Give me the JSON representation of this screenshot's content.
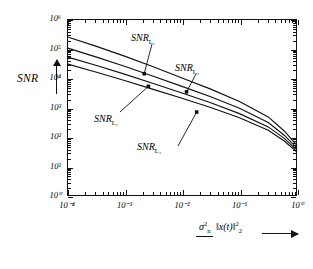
{
  "axes": {
    "y_title": "SNR",
    "y_ticks": [
      "10⁰",
      "10¹",
      "10²",
      "10³",
      "10⁴",
      "10⁵",
      "10⁶"
    ],
    "y_tick_mantissa": "10",
    "x_ticks": [
      "10⁻⁴",
      "10⁻³",
      "10⁻²",
      "10⁻¹",
      "10⁰"
    ],
    "x_label_numerator": "σ",
    "x_label_num_sup": "2",
    "x_label_num_sub": "n",
    "x_label_denominator_open": "‖",
    "x_label_denominator_body": "x(t)",
    "x_label_denominator_close": "‖",
    "x_label_den_sup": "2",
    "x_label_den_sub": "2"
  },
  "curve_labels": {
    "c1": "SNR",
    "c1_sub": "L₁",
    "c2": "SNR",
    "c2_sub": "L₂",
    "c3": "SNR",
    "c3_sub": "L₃",
    "c4": "SNR",
    "c4_sub": "L₄"
  },
  "chart_data": {
    "type": "line",
    "title": "",
    "xlabel": "σ²_n / ‖x(t)‖²₂",
    "ylabel": "SNR",
    "xscale": "log",
    "yscale": "log",
    "xlim": [
      0.0001,
      1
    ],
    "ylim": [
      1,
      1000000
    ],
    "grid": false,
    "legend": "annotations-on-curves",
    "frame": true,
    "line_color": "#111111",
    "x": [
      0.0001,
      0.000316,
      0.001,
      0.00316,
      0.01,
      0.0316,
      0.1,
      0.316,
      0.6,
      1.0
    ],
    "series": [
      {
        "name": "SNR_L1",
        "values": [
          250000,
          120000,
          55000,
          24000,
          10000,
          4200,
          1600,
          480,
          160,
          52
        ]
      },
      {
        "name": "SNR_L2",
        "values": [
          105000,
          52000,
          25000,
          11500,
          5200,
          2300,
          950,
          310,
          115,
          42
        ]
      },
      {
        "name": "SNR_L3",
        "values": [
          52000,
          27000,
          13500,
          6500,
          3100,
          1450,
          620,
          220,
          90,
          36
        ]
      },
      {
        "name": "SNR_L4",
        "values": [
          30000,
          16000,
          8200,
          4100,
          2050,
          1000,
          450,
          170,
          73,
          31
        ]
      }
    ],
    "annotations": [
      {
        "label": "SNR_L1",
        "points_to_series": "SNR_L1",
        "point_xy": [
          0.0022,
          14000
        ]
      },
      {
        "label": "SNR_L2",
        "points_to_series": "SNR_L2",
        "point_xy": [
          0.012,
          3400
        ]
      },
      {
        "label": "SNR_L3",
        "points_to_series": "SNR_L3",
        "point_xy": [
          0.0026,
          5200
        ]
      },
      {
        "label": "SNR_L4",
        "points_to_series": "SNR_L4",
        "point_xy": [
          0.018,
          700
        ]
      }
    ]
  }
}
